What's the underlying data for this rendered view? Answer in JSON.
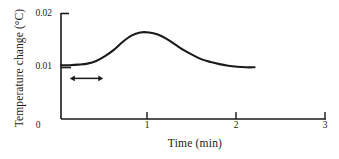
{
  "chart_data": {
    "type": "line",
    "title": "",
    "subtitle": "",
    "xlabel": "Time (min)",
    "ylabel": "Temperature change (°C)",
    "xlim": [
      0,
      3
    ],
    "ylim": [
      0,
      0.02
    ],
    "grid": false,
    "legend": null,
    "x_ticks": [
      {
        "value": 0,
        "label": "0"
      },
      {
        "value": 1,
        "label": "1"
      },
      {
        "value": 2,
        "label": "2"
      },
      {
        "value": 3,
        "label": "3"
      }
    ],
    "y_ticks": [
      {
        "value": 0.01,
        "label": "0.01"
      },
      {
        "value": 0.02,
        "label": "0.02"
      }
    ],
    "series": [
      {
        "name": "Temperature change",
        "x": [
          0.0,
          0.1,
          0.2,
          0.3,
          0.4,
          0.5,
          0.6,
          0.7,
          0.8,
          0.9,
          1.0,
          1.1,
          1.2,
          1.3,
          1.4,
          1.5,
          1.6,
          1.7,
          1.8,
          1.9,
          2.0,
          2.1,
          2.2
        ],
        "y": [
          0.0102,
          0.0102,
          0.0103,
          0.0105,
          0.011,
          0.0119,
          0.0131,
          0.0146,
          0.0158,
          0.0164,
          0.0164,
          0.016,
          0.0152,
          0.0141,
          0.013,
          0.0121,
          0.0113,
          0.0108,
          0.0104,
          0.0101,
          0.0099,
          0.0098,
          0.0098
        ]
      }
    ],
    "annotations": [
      {
        "type": "double-arrow",
        "name": "time-interval-arrow",
        "x_start": 0.1,
        "x_end": 0.48,
        "y": 0.0077,
        "label": ""
      }
    ],
    "style": {
      "line_color": "#1a1a1a",
      "axis_color": "#1a1a1a",
      "background": "#ffffff"
    }
  }
}
